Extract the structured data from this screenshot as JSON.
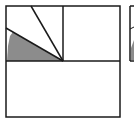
{
  "diagram": {
    "type": "geometry-figure",
    "colors": {
      "stroke": "#1a1a1a",
      "shade": "#8c8c8c",
      "background": "#ffffff"
    },
    "outer_square": {
      "x": 6,
      "y": 6,
      "w": 114,
      "h": 111
    },
    "center": {
      "x": 63,
      "y": 61
    },
    "segments": [
      {
        "from": [
          63,
          61
        ],
        "to": [
          31,
          6
        ]
      },
      {
        "from": [
          63,
          61
        ],
        "to": [
          6,
          28
        ]
      }
    ],
    "shaded_polygon": "9,61 63,61 13,32 10,36 8,48 7,61",
    "partial_adjacent_figure": {
      "x": 130,
      "y": 6,
      "h": 56
    }
  }
}
